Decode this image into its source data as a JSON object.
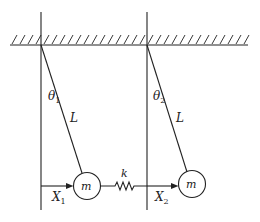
{
  "diagram": {
    "colors": {
      "stroke": "#222222",
      "background": "#ffffff"
    },
    "labels": {
      "theta1": "θ",
      "theta1_sub": "1",
      "theta2": "θ",
      "theta2_sub": "2",
      "length1": "L",
      "length2": "L",
      "mass1": "m",
      "mass2": "m",
      "spring": "k",
      "x1": "X",
      "x1_sub": "1",
      "x2": "X",
      "x2_sub": "2"
    }
  }
}
